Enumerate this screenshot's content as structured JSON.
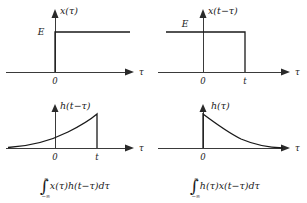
{
  "figure": {
    "background_color": "#ffffff",
    "line_color": "#1a1a1a",
    "axis_color": "#3a3a3a"
  },
  "panels": [
    {
      "id": "top-left",
      "function_label": "x(τ)",
      "amplitude_label": "E",
      "origin_label": "0",
      "axis_label": "τ",
      "tick_labels": [
        "0"
      ],
      "signal_type": "step",
      "signal_description": "Step of height E starting at τ = 0 and continuing to the right"
    },
    {
      "id": "top-right",
      "function_label": "x(t−τ)",
      "amplitude_label": "E",
      "origin_label": "0",
      "axis_label": "τ",
      "tick_labels": [
        "0",
        "t"
      ],
      "signal_type": "rectangular-pulse",
      "signal_description": "Rectangular pulse of height E extending from the left to τ = t"
    },
    {
      "id": "bottom-left",
      "function_label": "h(t−τ)",
      "amplitude_label": "",
      "origin_label": "0",
      "axis_label": "τ",
      "tick_labels": [
        "0",
        "t"
      ],
      "signal_type": "rising-exponential",
      "signal_description": "Exponential rising from the left, peaking at τ = t then dropping to zero"
    },
    {
      "id": "bottom-right",
      "function_label": "h(τ)",
      "amplitude_label": "",
      "origin_label": "0",
      "axis_label": "τ",
      "tick_labels": [
        "0"
      ],
      "signal_type": "decaying-exponential",
      "signal_description": "Exponential decaying from a peak at τ = 0 toward zero"
    }
  ],
  "formulas": [
    {
      "id": "formula-left",
      "upper_limit": "∞",
      "lower_limit": "−∞",
      "integrand": "x(τ)h(t−τ)dτ"
    },
    {
      "id": "formula-right",
      "upper_limit": "∞",
      "lower_limit": "−∞",
      "integrand": "h(τ)x(t−τ)dτ"
    }
  ]
}
